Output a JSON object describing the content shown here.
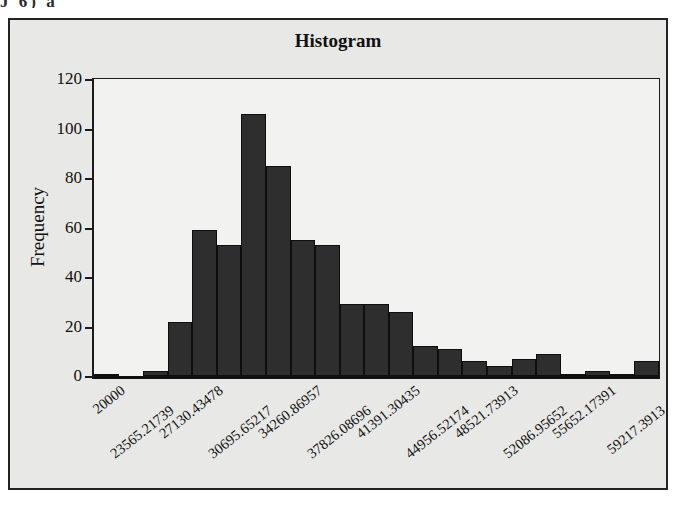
{
  "scan_artifact_text": "J 6) a",
  "figure": {
    "title": "Histogram",
    "background_color": "#e8e8e6",
    "plot_background_color": "#f2f2f0",
    "border_color": "#232323",
    "bar_color": "#2e2e2e"
  },
  "chart_data": {
    "type": "bar",
    "title": "Histogram",
    "xlabel": "",
    "ylabel": "Frequency",
    "ylim": [
      0,
      120
    ],
    "grid": false,
    "legend": null,
    "ytick_labels": [
      "0",
      "20",
      "40",
      "60",
      "80",
      "100",
      "120"
    ],
    "ytick_values": [
      0,
      20,
      40,
      60,
      80,
      100,
      120
    ],
    "bin_edges": [
      20000,
      21782.608695,
      23565.21739,
      25347.826085,
      27130.43478,
      28913.043475,
      30695.65217,
      32478.260865,
      34260.86957,
      36043.478265,
      37826.08696,
      39608.695655,
      41391.30435,
      43173.913045,
      44956.52174,
      46739.130435,
      48521.73913,
      50304.347825,
      52086.95652,
      53869.565215,
      55652.17391,
      57434.782605,
      59217.3913,
      61000.0
    ],
    "xtick_labels": [
      "20000",
      "23565.21739",
      "27130.43478",
      "30695.65217",
      "34260.86957",
      "37826.08696",
      "41391.30435",
      "44956.52174",
      "48521.73913",
      "52086.95652",
      "55652.17391",
      "59217.3913"
    ],
    "categories": [
      "20000",
      "21782.6",
      "23565.2",
      "25347.8",
      "27130.4",
      "28913.0",
      "30695.7",
      "32478.3",
      "34260.9",
      "36043.5",
      "37826.1",
      "39608.7",
      "41391.3",
      "43173.9",
      "44956.5",
      "46739.1",
      "48521.7",
      "50304.3",
      "52087.0",
      "53869.6",
      "55652.2",
      "57434.8",
      "59217.4"
    ],
    "values": [
      1,
      0,
      2,
      22,
      59,
      53,
      106,
      85,
      55,
      53,
      29,
      29,
      26,
      12,
      11,
      6,
      4,
      7,
      9,
      1,
      2,
      1,
      6
    ]
  }
}
